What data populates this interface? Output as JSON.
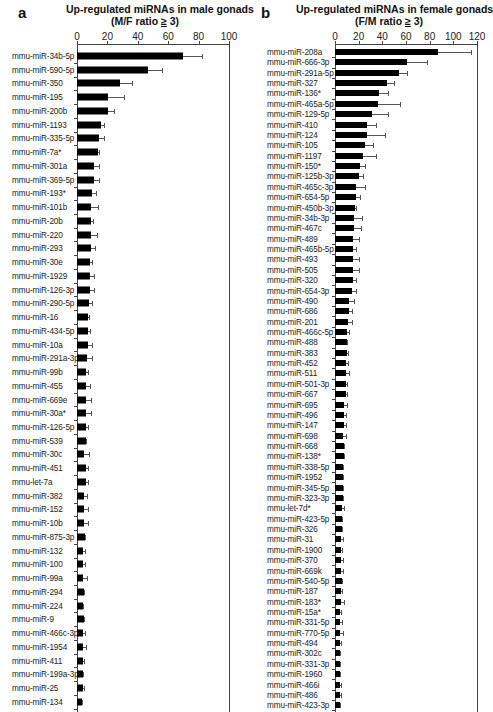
{
  "panels": {
    "a": {
      "letter": "a",
      "title_line1": "Up-regulated miRNAs in male gonads",
      "title_line2_prefix": "(M/F ratio ",
      "title_line2_ge": "≥",
      "title_line2_suffix": " 3)"
    },
    "b": {
      "letter": "b",
      "title_line1": "Up-regulated miRNAs in female gonads",
      "title_line2_prefix": "(F/M ratio ",
      "title_line2_ge": "≥",
      "title_line2_suffix": " 3)"
    }
  },
  "chart_data": [
    {
      "type": "bar",
      "orientation": "horizontal",
      "panel": "a",
      "title": "Up-regulated miRNAs in male gonads (M/F ratio ≥ 3)",
      "xlabel": "",
      "ylabel": "",
      "xlim": [
        0,
        100
      ],
      "xticks": [
        0,
        20,
        40,
        60,
        80,
        100
      ],
      "xaxis_position": "top",
      "grid": false,
      "error_bars": true,
      "categories": [
        "mmu-miR-34b-5p",
        "mmu-miR-590-5p",
        "mmu-miR-350",
        "mmu-miR-195",
        "mmu-miR-200b",
        "mmu-miR-1193",
        "mmu-miR-335-5p",
        "mmu-miR-7a*",
        "mmu-miR-301a",
        "mmu-miR-369-5p",
        "mmu-miR-193*",
        "mmu-miR-101b",
        "mmu-miR-20b",
        "mmu-miR-220",
        "mmu-miR-293",
        "mmu-miR-30e",
        "mmu-miR-1929",
        "mmu-miR-126-3p",
        "mmu-miR-290-5p",
        "mmu-miR-16",
        "mmu-miR-434-5p",
        "mmu-miR-10a",
        "mmu-miR-291a-3p",
        "mmu-miR-99b",
        "mmu-miR-455",
        "mmu-miR-669e",
        "mmu-miR-30a*",
        "mmu-miR-126-5p",
        "mmu-miR-539",
        "mmu-miR-30c",
        "mmu-miR-451",
        "mmu-let-7a",
        "mmu-miR-382",
        "mmu-miR-152",
        "mmu-miR-10b",
        "mmu-miR-875-3p",
        "mmu-miR-132",
        "mmu-miR-100",
        "mmu-miR-99a",
        "mmu-miR-294",
        "mmu-miR-224",
        "mmu-miR-9",
        "mmu-miR-466c-3p",
        "mmu-miR-1954",
        "mmu-miR-411",
        "mmu-miR-199a-3p",
        "mmu-miR-25",
        "mmu-miR-134"
      ],
      "values": [
        69.7,
        47,
        28.5,
        20.5,
        20.5,
        15.5,
        14.5,
        14,
        11.5,
        11,
        10,
        9.5,
        9.5,
        9.5,
        9.3,
        8.7,
        8.7,
        8.3,
        8,
        7.2,
        7,
        7,
        6.5,
        5.7,
        5.7,
        5.7,
        5.7,
        6,
        5.9,
        4.9,
        5.7,
        6,
        4.6,
        4.6,
        4.6,
        5.2,
        3.9,
        3.9,
        3.7,
        4.4,
        3.7,
        4.4,
        3.9,
        3.7,
        3.9,
        3.9,
        3.7,
        3.3
      ],
      "error_upper": [
        82,
        56,
        36,
        31,
        24.5,
        17.5,
        18,
        14.5,
        14.5,
        14.5,
        12.5,
        13.5,
        10.5,
        13,
        12,
        10,
        11.3,
        11.3,
        9.8,
        8,
        8.7,
        9.8,
        10,
        7.4,
        8.5,
        8.9,
        9.3,
        7,
        6.2,
        8,
        7,
        7,
        6.5,
        7.2,
        7.2,
        5.5,
        5.4,
        5.4,
        6.3,
        4.8,
        4,
        4.8,
        5.4,
        5.7,
        4.6,
        4.2,
        4.3,
        3.6
      ]
    },
    {
      "type": "bar",
      "orientation": "horizontal",
      "panel": "b",
      "title": "Up-regulated miRNAs in female gonads (F/M ratio ≥ 3)",
      "xlabel": "",
      "ylabel": "",
      "xlim": [
        0,
        120
      ],
      "xticks": [
        0,
        20,
        40,
        60,
        80,
        100,
        120
      ],
      "xaxis_position": "top",
      "grid": false,
      "error_bars": true,
      "categories": [
        "mmu-miR-208a",
        "mmu-miR-666-3p",
        "mmu-miR-291a-5p",
        "mmu-miR-327",
        "mmu-miR-136*",
        "mmu-miR-465a-5p",
        "mmu-miR-129-5p",
        "mmu-miR-410",
        "mmu-miR-124",
        "mmu-miR-105",
        "mmu-miR-1197",
        "mmu-miR-150*",
        "mmu-miR-125b-3p",
        "mmu-miR-465c-3p",
        "mmu-miR-654-5p",
        "mmu-miR-450b-3p",
        "mmu-miR-34b-3p",
        "mmu-miR-467c",
        "mmu-miR-489",
        "mmu-miR-465b-5p",
        "mmu-miR-493",
        "mmu-miR-505",
        "mmu-miR-320",
        "mmu-miR-654-3p",
        "mmu-miR-490",
        "mmu-miR-686",
        "mmu-miR-201",
        "mmu-miR-466c-5p",
        "mmu-miR-488",
        "mmu-miR-383",
        "mmu-miR-452",
        "mmu-miR-511",
        "mmu-miR-501-3p",
        "mmu-miR-667",
        "mmu-miR-695",
        "mmu-miR-496",
        "mmu-miR-147",
        "mmu-miR-698",
        "mmu-miR-668",
        "mmu-miR-138*",
        "mmu-miR-338-5p",
        "mmu-miR-1952",
        "mmu-miR-345-5p",
        "mmu-miR-323-3p",
        "mmu-let-7d*",
        "mmu-miR-423-5p",
        "mmu-miR-326",
        "mmu-miR-31",
        "mmu-miR-1900",
        "mmu-miR-370",
        "mmu-miR-669k",
        "mmu-miR-540-5p",
        "mmu-miR-187",
        "mmu-miR-183*",
        "mmu-miR-15a*",
        "mmu-miR-331-5p",
        "mmu-miR-770-5p",
        "mmu-miR-494",
        "mmu-miR-302c",
        "mmu-miR-331-3p",
        "mmu-miR-1960",
        "mmu-miR-466i",
        "mmu-miR-486",
        "mmu-miR-423-3p"
      ],
      "values": [
        87,
        61,
        54,
        44,
        37,
        36,
        31,
        27,
        27,
        25,
        24,
        21,
        20,
        18,
        18,
        17,
        16,
        16,
        15,
        15,
        15,
        15,
        15,
        14,
        12,
        12,
        11,
        10,
        10,
        10,
        9,
        9,
        9,
        9,
        8,
        8,
        8,
        7,
        7.5,
        7.5,
        6.5,
        6.5,
        6.5,
        6.5,
        6,
        5.5,
        5.5,
        5,
        5,
        5,
        5,
        5.5,
        5,
        5,
        4.5,
        4.5,
        4.5,
        4,
        4,
        4,
        4,
        4,
        4,
        4
      ],
      "error_upper": [
        115,
        78,
        61,
        50,
        45,
        55,
        45,
        35,
        42,
        32,
        35,
        25,
        24,
        25,
        21,
        18,
        23,
        22,
        20,
        18,
        20,
        20,
        18,
        18,
        16,
        14,
        14,
        12,
        10.5,
        11,
        11,
        12,
        10,
        10,
        10,
        9,
        9,
        9,
        8,
        8,
        7,
        7,
        7,
        7,
        8,
        6,
        6,
        7,
        5.5,
        7,
        7,
        6,
        5.5,
        8,
        5,
        6,
        7,
        5,
        4.5,
        4.3,
        4.3,
        5,
        5,
        4.5
      ]
    }
  ]
}
